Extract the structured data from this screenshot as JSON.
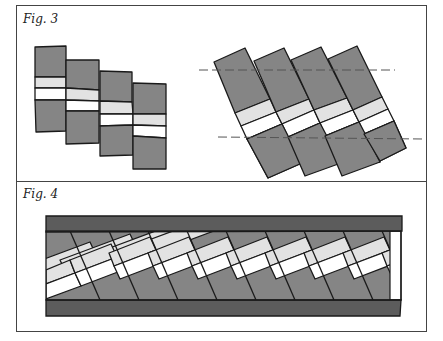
{
  "figures": [
    {
      "label": "Fig. 3",
      "description": "Four rectangular strips, each with a light gray band and a white band across the middle, shown offset (left) and rotated/interlocked between two dashed guide lines (right)."
    },
    {
      "label": "Fig. 4",
      "description": "A long panel bordered top and bottom by dark gray bars; inside, diagonal gray tiles with light gray and white bands form a continuous braided stripe."
    }
  ],
  "colors": {
    "tile_gray": "#858585",
    "band_light": "#e2e2e2",
    "band_white": "#ffffff",
    "bar_dark": "#5c5c5c",
    "outline": "#1a1a1a",
    "frame": "#444444"
  }
}
